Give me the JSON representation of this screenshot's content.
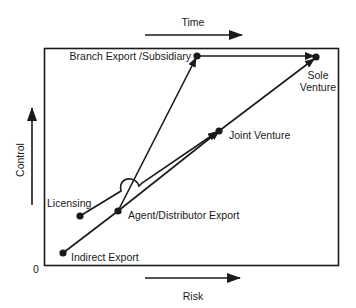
{
  "diagram": {
    "type": "strategy-path-diagram",
    "axes": {
      "x_label": "Risk",
      "y_label": "Control",
      "top_label": "Time",
      "origin_label": "0"
    },
    "nodes": [
      {
        "id": "indirect",
        "label": "Indirect Export"
      },
      {
        "id": "licensing",
        "label": "Licensing"
      },
      {
        "id": "agent",
        "label": "Agent/Distributor Export"
      },
      {
        "id": "joint",
        "label": "Joint Venture"
      },
      {
        "id": "branch",
        "label": "Branch Export /Subsidiary"
      },
      {
        "id": "sole_line1",
        "label": "Sole"
      },
      {
        "id": "sole_line2",
        "label": "Venture"
      }
    ],
    "edges": [
      {
        "from": "Indirect Export",
        "to": "Sole Venture",
        "via": [
          "Agent/Distributor Export",
          "Joint Venture"
        ]
      },
      {
        "from": "Agent/Distributor Export",
        "to": "Branch Export /Subsidiary"
      },
      {
        "from": "Branch Export /Subsidiary",
        "to": "Sole Venture"
      },
      {
        "from": "Licensing",
        "to": "Joint Venture"
      }
    ],
    "colors": {
      "ink": "#1a1a1a",
      "background": "#ffffff"
    }
  }
}
